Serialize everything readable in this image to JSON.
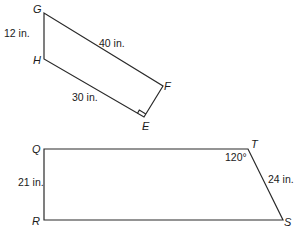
{
  "figures": [
    {
      "name": "quadrilateral-GHEF",
      "vertices": {
        "G": {
          "label": "G",
          "x": 44,
          "y": 13
        },
        "H": {
          "label": "H",
          "x": 44,
          "y": 59
        },
        "E": {
          "label": "E",
          "x": 144,
          "y": 117
        },
        "F": {
          "label": "F",
          "x": 163,
          "y": 86
        }
      },
      "measures": {
        "GH": "12 in.",
        "GF": "40 in.",
        "HE": "30 in."
      },
      "right_angle_at": "E"
    },
    {
      "name": "trapezoid-QTSR",
      "vertices": {
        "Q": {
          "label": "Q",
          "x": 44,
          "y": 149
        },
        "T": {
          "label": "T",
          "x": 248,
          "y": 149
        },
        "S": {
          "label": "S",
          "x": 283,
          "y": 220
        },
        "R": {
          "label": "R",
          "x": 44,
          "y": 220
        }
      },
      "measures": {
        "QR": "21 in.",
        "TS": "24 in.",
        "angle_T": "120°"
      }
    }
  ]
}
